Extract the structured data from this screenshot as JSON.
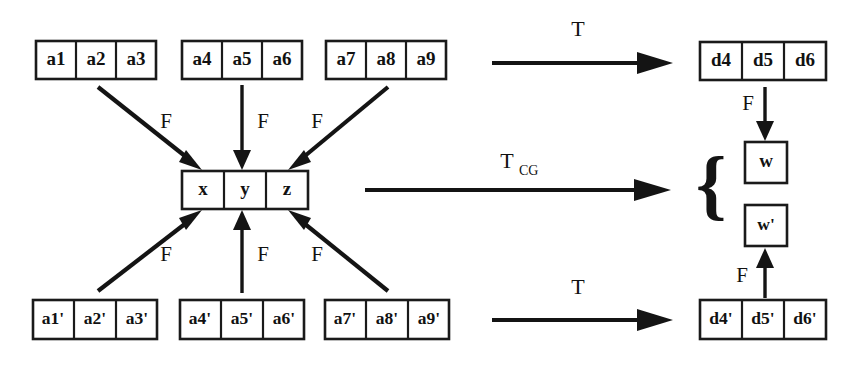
{
  "diagram": {
    "background_color": "#ffffff",
    "ink_color": "#141414",
    "source_rows": [
      {
        "name": "top-source-row",
        "groups": [
          {
            "name": "group-a1-a3",
            "cells": [
              "a1",
              "a2",
              "a3"
            ]
          },
          {
            "name": "group-a4-a6",
            "cells": [
              "a4",
              "a5",
              "a6"
            ]
          },
          {
            "name": "group-a7-a9",
            "cells": [
              "a7",
              "a8",
              "a9"
            ]
          }
        ]
      },
      {
        "name": "bottom-source-row",
        "groups": [
          {
            "name": "group-a1p-a3p",
            "cells": [
              "a1'",
              "a2'",
              "a3'"
            ]
          },
          {
            "name": "group-a4p-a6p",
            "cells": [
              "a4'",
              "a5'",
              "a6'"
            ]
          },
          {
            "name": "group-a7p-a9p",
            "cells": [
              "a7'",
              "a8'",
              "a9'"
            ]
          }
        ]
      }
    ],
    "center_box": {
      "name": "coarse-grained-state",
      "cells": [
        "x",
        "y",
        "z"
      ]
    },
    "target_rows": [
      {
        "name": "top-target-row",
        "cells": [
          "d4",
          "d5",
          "d6"
        ]
      },
      {
        "name": "bottom-target-row",
        "cells": [
          "d4'",
          "d5'",
          "d6'"
        ]
      }
    ],
    "result_boxes": [
      {
        "name": "result-w",
        "label": "w"
      },
      {
        "name": "result-w-prime",
        "label": "w'"
      }
    ],
    "brace": "{",
    "map_labels": {
      "top": "T",
      "middle_base": "T",
      "middle_sub": "CG",
      "bottom": "T"
    },
    "coarse_grain_labels": {
      "top_left": "F",
      "top_middle": "F",
      "top_right": "F",
      "bottom_left": "F",
      "bottom_middle": "F",
      "bottom_right": "F",
      "right_top": "F",
      "right_bottom": "F"
    }
  }
}
